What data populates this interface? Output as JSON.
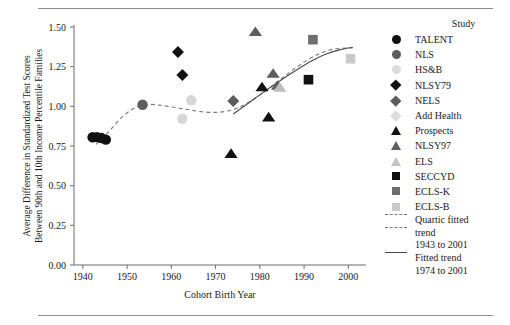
{
  "chart_data": {
    "type": "scatter",
    "title": "",
    "xlabel": "Cohort Birth Year",
    "ylabel": "Average Difference in Standardized Test Scores Between 90th and 10th Income Percentile Families",
    "xlim": [
      1938,
      2004
    ],
    "ylim": [
      0.0,
      1.5
    ],
    "xticks": [
      1940,
      1950,
      1960,
      1970,
      1980,
      1990,
      2000
    ],
    "yticks": [
      "0.00",
      "0.25",
      "0.50",
      "0.75",
      "1.00",
      "1.25",
      "1.50"
    ],
    "grid": false,
    "legend_position": "right",
    "legend_title": "Study",
    "series": [
      {
        "name": "TALENT",
        "marker": "circle",
        "color": "#111111",
        "points": [
          [
            1942.2,
            0.805
          ],
          [
            1943.2,
            0.806
          ],
          [
            1944.2,
            0.8
          ],
          [
            1945.2,
            0.79
          ]
        ]
      },
      {
        "name": "NLS",
        "marker": "circle",
        "color": "#5d5d5d",
        "points": [
          [
            1953.5,
            1.01
          ]
        ]
      },
      {
        "name": "HS&B",
        "marker": "circle",
        "color": "#d6d6d6",
        "points": [
          [
            1964.5,
            1.038
          ],
          [
            1962.5,
            0.922
          ]
        ]
      },
      {
        "name": "NLSY79",
        "marker": "diamond",
        "color": "#111111",
        "points": [
          [
            1961.5,
            1.342
          ],
          [
            1962.5,
            1.198
          ]
        ]
      },
      {
        "name": "NELS",
        "marker": "diamond",
        "color": "#5d5d5d",
        "points": [
          [
            1974.0,
            1.033
          ]
        ]
      },
      {
        "name": "Add Health",
        "marker": "diamond",
        "color": "#d6d6d6",
        "points": []
      },
      {
        "name": "Prospects",
        "marker": "triangle",
        "color": "#111111",
        "points": [
          [
            1982.0,
            0.93
          ],
          [
            1973.5,
            0.7
          ],
          [
            1980.5,
            1.12
          ]
        ]
      },
      {
        "name": "NLSY97",
        "marker": "triangle",
        "color": "#5d5d5d",
        "points": [
          [
            1979.0,
            1.468
          ],
          [
            1983.0,
            1.205
          ],
          [
            1984.0,
            1.13
          ]
        ]
      },
      {
        "name": "ELS",
        "marker": "triangle",
        "color": "#bdbdbd",
        "points": [
          [
            1984.5,
            1.118
          ]
        ]
      },
      {
        "name": "SECCYD",
        "marker": "square",
        "color": "#111111",
        "points": [
          [
            1991.0,
            1.168
          ]
        ]
      },
      {
        "name": "ECLS-K",
        "marker": "square",
        "color": "#6e6e6e",
        "points": [
          [
            1992.0,
            1.42
          ]
        ]
      },
      {
        "name": "ECLS-B",
        "marker": "square",
        "color": "#c9c9c9",
        "points": [
          [
            2000.5,
            1.3
          ]
        ]
      }
    ],
    "trends": [
      {
        "name": "Quartic fitted trend 1943 to 2001",
        "style": "dashed",
        "color": "#7a7a7a",
        "points": [
          [
            1943,
            0.76
          ],
          [
            1946,
            0.845
          ],
          [
            1949,
            0.935
          ],
          [
            1952,
            0.995
          ],
          [
            1955,
            1.012
          ],
          [
            1958,
            1.005
          ],
          [
            1961,
            0.992
          ],
          [
            1964,
            0.978
          ],
          [
            1967,
            0.966
          ],
          [
            1970,
            0.962
          ],
          [
            1973,
            0.972
          ],
          [
            1976,
            1.003
          ],
          [
            1979,
            1.053
          ],
          [
            1982,
            1.113
          ],
          [
            1985,
            1.177
          ],
          [
            1988,
            1.24
          ],
          [
            1991,
            1.296
          ],
          [
            1994,
            1.338
          ],
          [
            1997,
            1.362
          ],
          [
            2001,
            1.368
          ]
        ]
      },
      {
        "name": "Fitted trend 1974 to 2001",
        "style": "solid",
        "color": "#4a4a4a",
        "points": [
          [
            1974,
            0.952
          ],
          [
            1977,
            1.012
          ],
          [
            1980,
            1.072
          ],
          [
            1983,
            1.131
          ],
          [
            1986,
            1.188
          ],
          [
            1989,
            1.242
          ],
          [
            1992,
            1.291
          ],
          [
            1995,
            1.33
          ],
          [
            1998,
            1.356
          ],
          [
            2001,
            1.372
          ]
        ]
      }
    ]
  },
  "legend": {
    "title": "Study",
    "entries": [
      {
        "label": "TALENT",
        "marker": "circle",
        "color": "#111111"
      },
      {
        "label": "NLS",
        "marker": "circle",
        "color": "#5d5d5d"
      },
      {
        "label": "HS&B",
        "marker": "circle",
        "color": "#dcdcdc"
      },
      {
        "label": "NLSY79",
        "marker": "diamond",
        "color": "#111111"
      },
      {
        "label": "NELS",
        "marker": "diamond",
        "color": "#5d5d5d"
      },
      {
        "label": "Add Health",
        "marker": "diamond",
        "color": "#dcdcdc"
      },
      {
        "label": "Prospects",
        "marker": "triangle",
        "color": "#111111"
      },
      {
        "label": "NLSY97",
        "marker": "triangle",
        "color": "#5d5d5d"
      },
      {
        "label": "ELS",
        "marker": "triangle",
        "color": "#c4c4c4"
      },
      {
        "label": "SECCYD",
        "marker": "square",
        "color": "#111111"
      },
      {
        "label": "ECLS-K",
        "marker": "square",
        "color": "#6e6e6e"
      },
      {
        "label": "ECLS-B",
        "marker": "square",
        "color": "#c9c9c9"
      }
    ],
    "trend_dashed_line1": "Quartic fitted",
    "trend_dashed_line2": "trend",
    "trend_dashed_line3": "1943 to 2001",
    "trend_solid_line1": "Fitted trend",
    "trend_solid_line2": "1974 to 2001"
  }
}
